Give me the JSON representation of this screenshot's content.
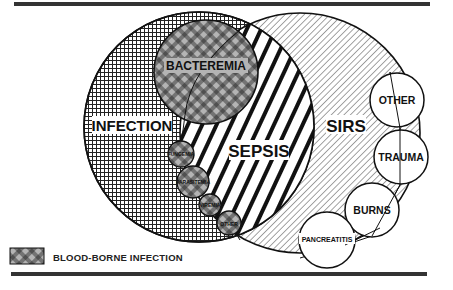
{
  "diagram": {
    "type": "venn",
    "sets": {
      "infection": {
        "label": "INFECTION",
        "pattern": "fine-grid"
      },
      "sirs": {
        "label": "SIRS",
        "pattern": "fine-diagonal"
      },
      "sepsis": {
        "label": "SEPSIS",
        "pattern": "bold-diagonal",
        "definition": "intersection of INFECTION and SIRS"
      },
      "bacteremia": {
        "label": "BACTEREMIA",
        "pattern": "blood-borne"
      }
    },
    "blood_borne_circles": [
      {
        "label": "FUNGEMIA"
      },
      {
        "label": "PARASITEMIA"
      },
      {
        "label": "VIREMIA"
      },
      {
        "label": "OTHER"
      }
    ],
    "sirs_cause_circles": [
      {
        "label": "OTHER"
      },
      {
        "label": "TRAUMA"
      },
      {
        "label": "BURNS"
      },
      {
        "label": "PANCREATITIS"
      }
    ],
    "legend": {
      "swatch_pattern": "blood-borne",
      "label": "BLOOD-BORNE INFECTION"
    },
    "colors": {
      "ink": "#111111",
      "blood_borne_fill": "#b4b4b4",
      "background": "#ffffff"
    }
  }
}
